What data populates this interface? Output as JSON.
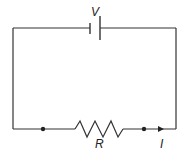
{
  "diagram": {
    "type": "circuit",
    "components": {
      "battery": {
        "label": "V"
      },
      "resistor": {
        "label": "R"
      },
      "current": {
        "label": "I"
      }
    },
    "colors": {
      "wire": "#333333",
      "background": "#ffffff"
    }
  }
}
